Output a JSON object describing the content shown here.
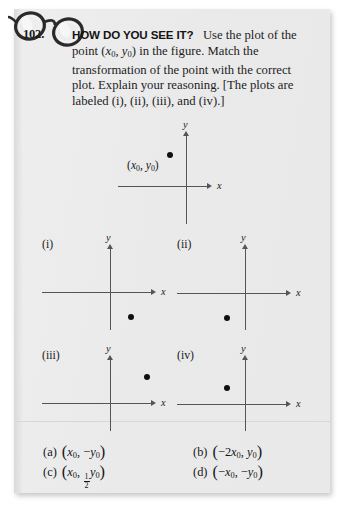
{
  "page": {
    "problem_number": "102.",
    "icon": "eyeglasses-icon"
  },
  "question": {
    "heading": "HOW DO YOU SEE IT?",
    "line1": "Use the plot of",
    "line2_a": "the point (",
    "line2_x": "x",
    "line2_xsub": "0",
    "line2_comma": ", ",
    "line2_y": "y",
    "line2_ysub": "0",
    "line2_b": ") in the figure. Match the",
    "line3": "transformation of the point with the correct",
    "line4": "plot. Explain your reasoning. [The plots are",
    "line5": "labeled (i), (ii), (iii), and (iv).]"
  },
  "main_plot": {
    "name": "main-plot",
    "x_axis_label": "x",
    "y_axis_label": "y",
    "point_label_open": "(",
    "point_label_x": "x",
    "point_label_xsub": "0",
    "point_label_comma": ", ",
    "point_label_y": "y",
    "point_label_ysub": "0",
    "point_label_close": ")",
    "point": {
      "x": -0.35,
      "y": 0.62
    }
  },
  "plots": [
    {
      "id": "i",
      "label": "(i)",
      "x_axis_label": "x",
      "y_axis_label": "y",
      "point": {
        "x": 0.35,
        "y": -0.62
      }
    },
    {
      "id": "ii",
      "label": "(ii)",
      "x_axis_label": "x",
      "y_axis_label": "y",
      "point": {
        "x": -0.35,
        "y": -0.62
      }
    },
    {
      "id": "iii",
      "label": "(iii)",
      "x_axis_label": "x",
      "y_axis_label": "y",
      "point": {
        "x": 0.72,
        "y": 0.62
      }
    },
    {
      "id": "iv",
      "label": "(iv)",
      "x_axis_label": "x",
      "y_axis_label": "y",
      "point": {
        "x": -0.35,
        "y": 0.33
      }
    }
  ],
  "choices": {
    "a": {
      "marker": "(a)",
      "open": "(",
      "x": "x",
      "xsub": "0",
      "comma": ", ",
      "minus": "−",
      "y": "y",
      "ysub": "0",
      "close": ")"
    },
    "b": {
      "marker": "(b)",
      "open": "(",
      "minus": "−",
      "coef": "2",
      "x": "x",
      "xsub": "0",
      "comma": ", ",
      "y": "y",
      "ysub": "0",
      "close": ")"
    },
    "c": {
      "marker": "(c)",
      "open": "(",
      "x": "x",
      "xsub": "0",
      "comma": ", ",
      "frac_num": "1",
      "frac_den": "2",
      "y": "y",
      "ysub": "0",
      "close": ")"
    },
    "d": {
      "marker": "(d)",
      "open": "(",
      "minus1": "−",
      "x": "x",
      "xsub": "0",
      "comma": ", ",
      "minus2": "−",
      "y": "y",
      "ysub": "0",
      "close": ")"
    }
  },
  "colors": {
    "paper": "#ececed",
    "ink": "#1d1d1d",
    "axis": "#555558",
    "dot": "#101010"
  }
}
